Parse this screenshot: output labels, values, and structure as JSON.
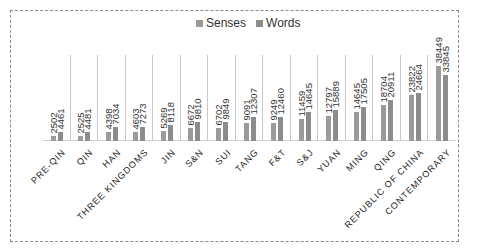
{
  "chart_data": {
    "type": "bar",
    "title": "",
    "xlabel": "",
    "ylabel": "",
    "categories": [
      "PRE-QIN",
      "QIN",
      "HAN",
      "THREE KINGDOMS",
      "JIN",
      "S&N",
      "SUI",
      "TANG",
      "F&T",
      "S&J",
      "YUAN",
      "MING",
      "QING",
      "REPUBLIC OF CHINA",
      "CONTEMPORARY"
    ],
    "series": [
      {
        "name": "Senses",
        "color": "#9a9a9a",
        "values": [
          2502,
          2525,
          4398,
          4603,
          5269,
          6672,
          6702,
          9091,
          9249,
          11459,
          12797,
          14645,
          18704,
          23822,
          38449
        ]
      },
      {
        "name": "Words",
        "color": "#8c8c8c",
        "values": [
          4461,
          4481,
          7034,
          7273,
          8118,
          9810,
          9849,
          12307,
          12460,
          14645,
          15889,
          17505,
          20911,
          24664,
          33845
        ]
      }
    ],
    "ylim": [
      0,
      44000
    ],
    "grid": false,
    "legend_position": "top",
    "data_labels": true
  }
}
